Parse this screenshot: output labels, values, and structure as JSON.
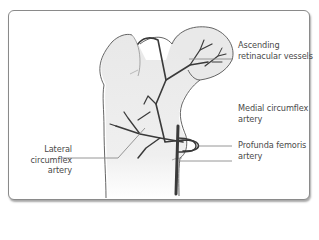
{
  "diagram": {
    "labels": [
      {
        "id": "ascending",
        "line1": "Ascending",
        "line2": "retinacular vessels"
      },
      {
        "id": "medial",
        "line1": "Medial circumflex",
        "line2": "artery"
      },
      {
        "id": "profunda",
        "line1": "Profunda femoris",
        "line2": "artery"
      },
      {
        "id": "lateral",
        "line1": "Lateral",
        "line2": "circumflex artery"
      }
    ],
    "colors": {
      "bone_fill": "#ebebeb",
      "bone_outline": "#555555",
      "vessel": "#3a3a3a",
      "leader_line": "#8a8a8a",
      "label_text": "#4a4a4a",
      "frame_border": "#8a8a8a"
    }
  }
}
